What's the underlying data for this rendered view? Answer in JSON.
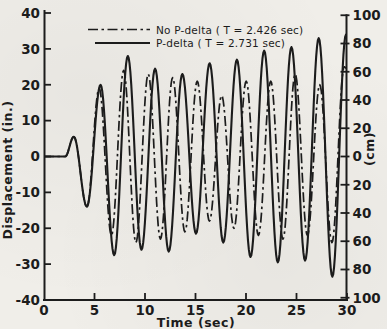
{
  "figure": {
    "background_color": "#f0eee9",
    "ink_color": "#1c1c1c"
  },
  "legend": {
    "position": "top-center-inside",
    "items": [
      {
        "label": "No P-delta ( T = 2.426 sec)",
        "line_style": "dash-dot"
      },
      {
        "label": "P-delta ( T = 2.731 sec)",
        "line_style": "solid"
      }
    ]
  },
  "axes": {
    "x": {
      "title": "Time (sec)",
      "tick_values": [
        0,
        5,
        10,
        15,
        20,
        25,
        30
      ],
      "tick_labels": [
        "0",
        "5",
        "10",
        "15",
        "20",
        "25",
        "30"
      ],
      "range": [
        0,
        30
      ]
    },
    "y_left": {
      "title": "Displacement (in.)",
      "tick_values": [
        40,
        30,
        20,
        10,
        0,
        -10,
        -20,
        -30,
        -40
      ],
      "tick_labels": [
        "40",
        "30",
        "20",
        "10",
        "0",
        "-10",
        "-20",
        "-30",
        "-40"
      ],
      "range": [
        -40,
        40
      ]
    },
    "y_right": {
      "title": "(cm)",
      "tick_values_cm": [
        100,
        80,
        60,
        40,
        20,
        0,
        -20,
        -40,
        -60,
        -80,
        -100
      ],
      "tick_labels": [
        "100",
        "80",
        "60",
        "40",
        "20",
        "0",
        "20",
        "40",
        "60",
        "80",
        "100"
      ],
      "range_cm": [
        -100,
        100
      ]
    }
  },
  "chart_data": {
    "type": "line",
    "title": "",
    "xlabel": "Time (sec)",
    "ylabel_left": "Displacement (in.)",
    "ylabel_right": "(cm)",
    "xlim": [
      0,
      30
    ],
    "ylim_in": [
      -40,
      40
    ],
    "ylim_cm": [
      -100,
      100
    ],
    "grid": false,
    "legend_position": "top-center-inside",
    "interpolation": "cosine-through-extrema",
    "series": [
      {
        "name": "No P-delta (T = 2.426 sec)",
        "period_sec": 2.426,
        "style": "dash-dot",
        "extrema_t_y_in": [
          [
            0,
            0
          ],
          [
            2.1,
            0
          ],
          [
            2.95,
            5.5
          ],
          [
            4.25,
            -14
          ],
          [
            5.46,
            19
          ],
          [
            6.68,
            -22
          ],
          [
            7.89,
            24
          ],
          [
            9.1,
            -24
          ],
          [
            10.32,
            23
          ],
          [
            11.53,
            -23
          ],
          [
            12.74,
            22
          ],
          [
            13.95,
            -21
          ],
          [
            15.17,
            21
          ],
          [
            16.38,
            -18
          ],
          [
            17.59,
            17
          ],
          [
            18.81,
            -20
          ],
          [
            20.02,
            21
          ],
          [
            21.23,
            -22
          ],
          [
            22.45,
            21
          ],
          [
            23.66,
            -23
          ],
          [
            24.87,
            23
          ],
          [
            26.08,
            -22
          ],
          [
            27.3,
            20
          ],
          [
            28.51,
            -24
          ],
          [
            29.72,
            25
          ],
          [
            30,
            24.5
          ]
        ]
      },
      {
        "name": "P-delta (T = 2.731 sec)",
        "period_sec": 2.731,
        "style": "solid",
        "extrema_t_y_in": [
          [
            0,
            0
          ],
          [
            2.1,
            0
          ],
          [
            2.95,
            5.5
          ],
          [
            4.25,
            -14
          ],
          [
            5.6,
            20
          ],
          [
            6.95,
            -27.5
          ],
          [
            8.3,
            28
          ],
          [
            9.65,
            -26
          ],
          [
            11,
            24.5
          ],
          [
            12.35,
            -26.5
          ],
          [
            13.7,
            23
          ],
          [
            15.05,
            -21.5
          ],
          [
            16.4,
            26
          ],
          [
            17.75,
            -24
          ],
          [
            19.1,
            27
          ],
          [
            20.45,
            -28
          ],
          [
            21.8,
            29.5
          ],
          [
            23.15,
            -29.5
          ],
          [
            24.5,
            30.5
          ],
          [
            25.85,
            -29
          ],
          [
            27.2,
            33
          ],
          [
            28.55,
            -33.5
          ],
          [
            29.9,
            34
          ],
          [
            30,
            33.8
          ]
        ]
      }
    ]
  }
}
